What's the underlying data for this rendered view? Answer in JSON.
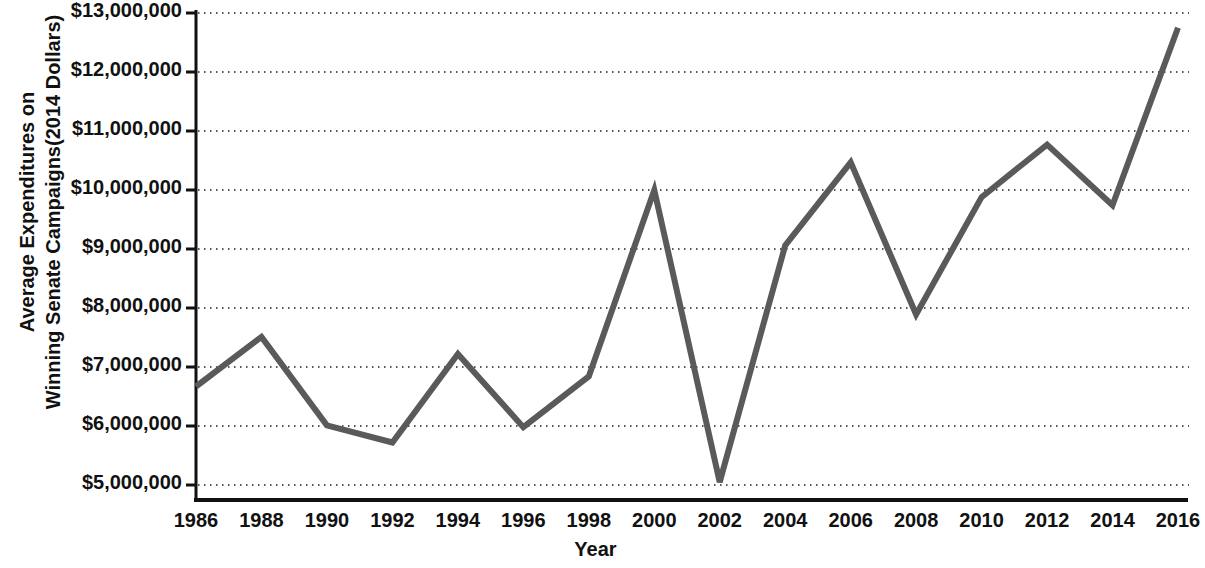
{
  "chart_data": {
    "type": "line",
    "title": "",
    "xlabel": "Year",
    "ylabel": "Average Expenditures on\nWinning Senate Campaigns(2014 Dollars)",
    "categories": [
      1986,
      1988,
      1990,
      1992,
      1994,
      1996,
      1998,
      2000,
      2002,
      2004,
      2006,
      2008,
      2010,
      2012,
      2014,
      2016
    ],
    "x_tick_labels": [
      "1986",
      "1988",
      "1990",
      "1992",
      "1994",
      "1996",
      "1998",
      "2000",
      "2002",
      "2004",
      "2006",
      "2008",
      "2010",
      "2012",
      "2014",
      "2016"
    ],
    "values": [
      6670000,
      7510000,
      6010000,
      5720000,
      7220000,
      5980000,
      6840000,
      10000000,
      5050000,
      9060000,
      10470000,
      7890000,
      9880000,
      10770000,
      9740000,
      12750000
    ],
    "y_tick_values": [
      5000000,
      6000000,
      7000000,
      8000000,
      9000000,
      10000000,
      11000000,
      12000000,
      13000000
    ],
    "y_tick_labels": [
      "$5,000,000",
      "$6,000,000",
      "$7,000,000",
      "$8,000,000",
      "$9,000,000",
      "$10,000,000",
      "$11,000,000",
      "$12,000,000",
      "$13,000,000"
    ],
    "ylim": [
      5000000,
      13000000
    ],
    "xlim": [
      1986,
      2016
    ],
    "grid": true,
    "grid_style": "dotted",
    "grid_color": "#555555",
    "line_color": "#5a5a5a",
    "line_width": 6,
    "axis_color": "#111111",
    "background_color": "#ffffff",
    "legend": "none"
  }
}
